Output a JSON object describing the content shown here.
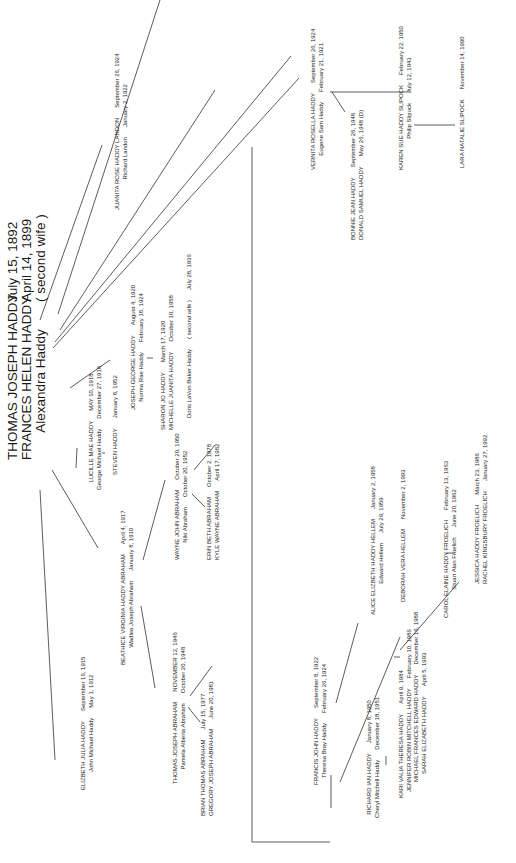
{
  "diagram": {
    "type": "family-tree",
    "orientation": "rotated-90-ccw",
    "root": {
      "line1": {
        "name": "THOMAS JOSEPH HADDY",
        "date": "July 15,  1892"
      },
      "line2": {
        "name": "FRANCES HELEN HADDY",
        "date": "April 14,  1899"
      },
      "line3": {
        "name": "Alexandra Haddy",
        "note": "( second wife )"
      }
    },
    "children": [
      {
        "id": "juanita",
        "name": "JUANITA ROSE HADDY LANDON",
        "date": "September 26, 1924",
        "spouse": "Richard Landon",
        "spouse_date": "January 2, 1922"
      },
      {
        "id": "vernita",
        "name": "VERNITA ROSELLA HADDY",
        "date": "September 26, 1924",
        "spouse": "Eugene Sam Haddy",
        "spouse_date": "February 21, 1921",
        "children": [
          {
            "name": "BONNIE JEAN HADDY",
            "date": "September 26, 1948"
          },
          {
            "name": "DONALD SAMUEL HADDY",
            "date": "May 26, 1948  (D)"
          },
          {
            "id": "karen",
            "name": "KAREN SUE HADDY SLIPOCK",
            "date": "February 22, 1950",
            "spouse": "Philip Slipock",
            "spouse_date": "July 12, 1943"
          },
          {
            "name": "LARA NATALIE SLIPOCK",
            "date": "November 14, 1990"
          }
        ]
      },
      {
        "id": "joseph",
        "name": "JOSEPH GEORGE HADDY",
        "date": "August 4, 1920",
        "spouse": "Norma Rae Haddy",
        "spouse_date": "February 18, 1924",
        "children": [
          {
            "name": "SHARON JO HADDY",
            "date": "March 17, 1920"
          },
          {
            "name": "MICHELLE JUANITA HADDY",
            "date": "October 10, 1958"
          }
        ],
        "second_wife": {
          "name": "Doris LaVon Baker Haddy",
          "note": "( second wife )",
          "date": "July 28, 1936"
        }
      },
      {
        "id": "lucille",
        "name": "LUCILLE MAE HADDY",
        "date": "MAY 10, 1918",
        "spouse": "George Michael Haddy",
        "spouse_date": "December 27, 1918",
        "children": [
          {
            "name": "STEVEN HADDY",
            "date": "January 8, 1952"
          }
        ]
      },
      {
        "id": "beathice",
        "name": "BEATHICE VIRGINIA HADDY ABRAHAM",
        "date": "April 4, 1917",
        "spouse": "Wadlea Joseph Abraham",
        "spouse_date": "January 8, 1910",
        "children": [
          {
            "name": "WAYNE JOHN ABRAHAM",
            "date": "October 20, 1950",
            "spouse": "Niki Abraham",
            "spouse_date": "October 20, 1952",
            "children": [
              {
                "name": "ERIN BETH ABRAHAM",
                "date": "October 2, 1978"
              },
              {
                "name": "KYLE WAYNE ABRAHAM",
                "date": "April 17, 1982"
              }
            ]
          },
          {
            "name": "THOMAS JOSEPH ABRAHAM",
            "date": "NOVEMBER 12, 1946",
            "spouse": "Pamela Alberta Abraham",
            "spouse_date": "October 20, 1948",
            "children": [
              {
                "name": "BRIAN THOMAS ABRAHAM",
                "date": "July 15, 1977"
              },
              {
                "name": "GREGORY JOSEPH ABRAHAM",
                "date": "June 20, 1981"
              }
            ]
          }
        ]
      },
      {
        "id": "elizbeth",
        "name": "ELIZBETH JULIA HADDY",
        "date": "September 16, 1915",
        "spouse": "John Michael Haddy",
        "spouse_date": "May 1, 1912"
      },
      {
        "id": "francis",
        "name": "FRANCIS JOHN HADDY",
        "date": "September 8, 1922",
        "spouse": "Theresa Bray Haddy",
        "spouse_date": "February 26, 1924",
        "children": [
          {
            "name": "RICHARD IAN HADDY",
            "date": "January 8, 1950",
            "spouse": "Cheryl Mitchell Haddy",
            "spouse_date": "December 18, 1951",
            "children": [
              {
                "name": "KARI VALIA THERESA HADDY",
                "date": "April 9, 1984"
              },
              {
                "name": "JENNIFER ROBIN MITCHELL HADDY",
                "date": "February 10, 1986"
              },
              {
                "name": "MICHAEL FRANCES EDWARD HADDY",
                "date": "December 16, 1988"
              },
              {
                "name": "SARAH ELIZABETH HADDY",
                "date": "April 5, 1993"
              }
            ]
          },
          {
            "name": "ALICE ELIZBETH HADDY HELLEM",
            "date": "January 2, 1958",
            "spouse": "Edward Hellem",
            "spouse_date": "July 29, 1959",
            "children": [
              {
                "name": "DEBORAH VERA HELLEM",
                "date": "November 2, 1993"
              }
            ]
          },
          {
            "name": "CAROL ELAINE HADDY FROELICH",
            "date": "February 13, 1963",
            "spouse": "Stuart Alan Froelich",
            "spouse_date": "June 20, 1962",
            "children": [
              {
                "name": "JESSICA HADDY FROELICH",
                "date": "March 23, 1986"
              },
              {
                "name": "RACHEL KINGSBURY FROELICH",
                "date": "January 27, 1992"
              }
            ]
          }
        ]
      }
    ]
  }
}
